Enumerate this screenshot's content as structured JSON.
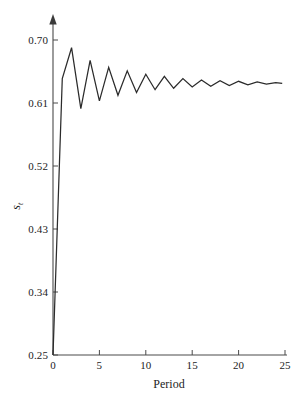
{
  "chart_data": {
    "type": "line",
    "title": "",
    "xlabel": "Period",
    "ylabel": "s",
    "ylabel_subscript": "t",
    "xlim": [
      0,
      25
    ],
    "ylim": [
      0.25,
      0.7
    ],
    "grid": false,
    "legend": null,
    "x_ticks": [
      "0",
      "5",
      "10",
      "15",
      "20",
      "25"
    ],
    "x_tick_values": [
      0,
      5,
      10,
      15,
      20,
      25
    ],
    "y_ticks": [
      "0.25",
      "0.34",
      "0.43",
      "0.52",
      "0.61",
      "0.70"
    ],
    "y_tick_values": [
      0.25,
      0.34,
      0.43,
      0.52,
      0.61,
      0.7
    ],
    "line_color": "#2b2b2b",
    "axis_color": "#4a4a4a",
    "series": [
      {
        "name": "s_t",
        "x": [
          0,
          1,
          2,
          3,
          4,
          5,
          6,
          7,
          8,
          9,
          10,
          11,
          12,
          13,
          14,
          15,
          16,
          17,
          18,
          19,
          20,
          21,
          22,
          23,
          24,
          24.7
        ],
        "values": [
          0.25,
          0.645,
          0.689,
          0.602,
          0.671,
          0.613,
          0.661,
          0.621,
          0.656,
          0.625,
          0.651,
          0.629,
          0.648,
          0.631,
          0.645,
          0.633,
          0.643,
          0.634,
          0.642,
          0.635,
          0.641,
          0.636,
          0.64,
          0.637,
          0.639,
          0.638
        ]
      }
    ],
    "converges_to": 0.638
  }
}
